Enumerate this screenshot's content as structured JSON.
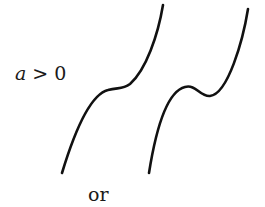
{
  "condition": {
    "variable": "a",
    "relation": " > 0"
  },
  "connector": "or",
  "curves": [
    {
      "name": "monotonic-cubic",
      "description": "increasing cubic with flat inflection point"
    },
    {
      "name": "cubic-with-turning-points",
      "description": "increasing cubic with local maximum and local minimum"
    }
  ],
  "colors": {
    "stroke": "#111111",
    "text": "#1a1a1a",
    "background": "#ffffff"
  }
}
